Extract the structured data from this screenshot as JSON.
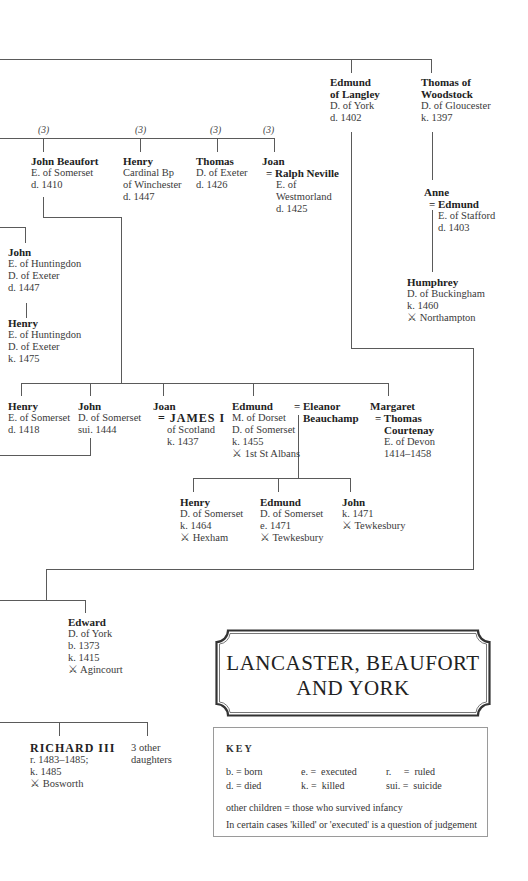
{
  "title": {
    "line1": "LANCASTER, BEAUFORT",
    "line2": "AND YORK"
  },
  "battle_symbol": "⚔",
  "generation1": [
    {
      "name_line1": "Edmund",
      "name_line2": "of Langley",
      "title": "D. of York",
      "dates": "d. 1402"
    },
    {
      "name_line1": "Thomas of",
      "name_line2": "Woodstock",
      "title": "D. of Gloucester",
      "dates": "k. 1397"
    }
  ],
  "beaufort_children": {
    "marriage_markers": [
      "(3)",
      "(3)",
      "(3)",
      "(3)"
    ],
    "members": [
      {
        "name": "John Beaufort",
        "title": "E. of Somerset",
        "dates": "d. 1410"
      },
      {
        "name": "Henry",
        "title1": "Cardinal Bp",
        "title2": "of Winchester",
        "dates": "d. 1447"
      },
      {
        "name": "Thomas",
        "title": "D. of Exeter",
        "dates": "d. 1426"
      },
      {
        "name": "Joan",
        "spouse": "= Ralph Neville",
        "spouse_title1": "E. of",
        "spouse_title2": "Westmorland",
        "spouse_dates": "d. 1425"
      }
    ]
  },
  "stafford": {
    "anne": {
      "name": "Anne",
      "spouse": "= Edmund",
      "spouse_title": "E. of Stafford",
      "spouse_dates": "d. 1403"
    },
    "humphrey": {
      "name": "Humphrey",
      "title": "D. of Buckingham",
      "dates": "k. 1460",
      "battle": "Northampton"
    }
  },
  "holland": {
    "john": {
      "name": "John",
      "title1": "E. of Huntingdon",
      "title2": "D. of Exeter",
      "dates": "d. 1447"
    },
    "henry": {
      "name": "Henry",
      "title1": "E. of Huntingdon",
      "title2": "D. of Exeter",
      "dates": "k. 1475"
    }
  },
  "somerset_children": [
    {
      "name": "Henry",
      "title": "E. of Somerset",
      "dates": "d. 1418"
    },
    {
      "name": "John",
      "title": "D. of Somerset",
      "dates": "sui. 1444"
    },
    {
      "name": "Joan",
      "spouse": "= JAMES I",
      "spouse_title": "of Scotland",
      "spouse_dates": "k. 1437"
    },
    {
      "name": "Edmund",
      "title1": "M. of Dorset",
      "title2": "D. of Somerset",
      "dates": "k. 1455",
      "battle": "1st St Albans",
      "spouse_line1": "= Eleanor",
      "spouse_line2": "Beauchamp"
    },
    {
      "name": "Margaret",
      "spouse_line1": "= Thomas",
      "spouse_line2": "Courtenay",
      "spouse_title": "E. of Devon",
      "spouse_dates": "1414–1458"
    }
  ],
  "edmund_children": [
    {
      "name": "Henry",
      "title": "D. of Somerset",
      "dates": "k. 1464",
      "battle": "Hexham"
    },
    {
      "name": "Edmund",
      "title": "D. of Somerset",
      "dates": "e. 1471",
      "battle": "Tewkesbury"
    },
    {
      "name": "John",
      "dates": "k. 1471",
      "battle": "Tewkesbury"
    }
  ],
  "edward": {
    "name": "Edward",
    "title": "D. of York",
    "born": "b. 1373",
    "dates": "k. 1415",
    "battle": "Agincourt"
  },
  "richard": {
    "name": "RICHARD III",
    "reign": "r. 1483–1485;",
    "dates": "k. 1485",
    "battle": "Bosworth"
  },
  "other_daughters": {
    "line1": "3 other",
    "line2": "daughters"
  },
  "key": {
    "heading": "KEY",
    "rows": [
      [
        {
          "abbr": "b.",
          "meaning": "born"
        },
        {
          "abbr": "e.",
          "meaning": "executed"
        },
        {
          "abbr": "r.",
          "meaning": "ruled"
        }
      ],
      [
        {
          "abbr": "d.",
          "meaning": "died"
        },
        {
          "abbr": "k.",
          "meaning": "killed"
        },
        {
          "abbr": "sui.",
          "meaning": "suicide"
        }
      ]
    ],
    "eq": "=",
    "note1": "other children = those who survived infancy",
    "note2": "In certain cases 'killed' or 'executed' is a question of judgement"
  }
}
